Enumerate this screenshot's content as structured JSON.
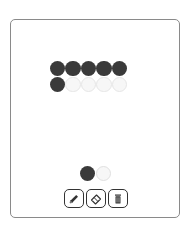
{
  "grid": {
    "rows": [
      [
        1,
        1,
        1,
        1,
        1
      ],
      [
        1,
        0,
        0,
        0,
        0
      ]
    ]
  },
  "palette": {
    "colors": [
      "#3a3a3a",
      "#f7f7f7"
    ]
  },
  "tools": [
    {
      "name": "pencil",
      "icon": "pencil-icon"
    },
    {
      "name": "eraser",
      "icon": "eraser-icon"
    },
    {
      "name": "trash",
      "icon": "trash-icon"
    }
  ]
}
